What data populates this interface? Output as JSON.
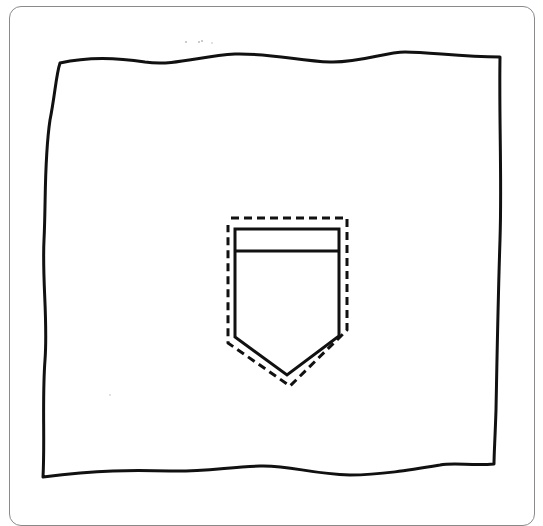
{
  "figure": {
    "colors": {
      "frame_border": "#8a8a8a",
      "ink": "#111111",
      "background": "#ffffff"
    },
    "fabric_outline": {
      "style": "wavy-solid",
      "corners": {
        "top_left": [
          60,
          63
        ],
        "top_right": [
          500,
          57
        ],
        "bottom_right": [
          494,
          464
        ],
        "bottom_left": [
          43,
          477
        ]
      }
    },
    "pocket": {
      "style": "solid",
      "rect": {
        "left": 235,
        "right": 339,
        "top": 229,
        "flap_line_y": 251,
        "side_bottom_y": 337
      },
      "point": [
        287,
        375
      ]
    },
    "seam_allowance": {
      "style": "dashed",
      "top_y": 218,
      "left_x": 228,
      "right_x": 347,
      "point": [
        290,
        386
      ]
    }
  }
}
